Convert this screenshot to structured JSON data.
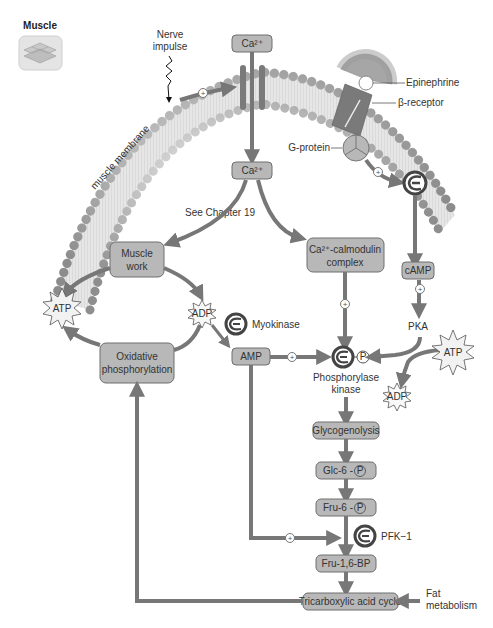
{
  "header": {
    "title": "Muscle",
    "icon": "muscle-tissue-icon"
  },
  "membrane": {
    "label": "muscle membrane",
    "nerve_impulse": [
      "Nerve",
      "impulse"
    ],
    "epinephrine": "Epinephrine",
    "beta_receptor": "β-receptor",
    "g_protein": "G-protein"
  },
  "nodes": {
    "ca_top": "Ca²⁺",
    "ca_inside": "Ca²⁺",
    "see_chapter": "See Chapter 19",
    "muscle_work": [
      "Muscle",
      "work"
    ],
    "ca_calmodulin": [
      "Ca²⁺-calmodulin",
      "complex"
    ],
    "camp": "cAMP",
    "pka": "PKA",
    "atp_left": "ATP",
    "adp_left": "ADP",
    "myokinase": "Myokinase",
    "amp": "AMP",
    "oxidative": [
      "Oxidative",
      "phosphorylation"
    ],
    "phosphorylase_kinase": [
      "Phosphorylase",
      "kinase"
    ],
    "phosphate": "P",
    "atp_right": "ATP",
    "adp_right": "ADP",
    "glycogenolysis": "Glycogenolysis",
    "glc6p": "Glc-6 -",
    "fru6p": "Fru-6 -",
    "pfk1": "PFK−1",
    "fru16bp": "Fru-1,6-BP",
    "tca": "Tricarboxylic acid cycle",
    "fat_metabolism": [
      "Fat",
      "metabolism"
    ]
  },
  "symbols": {
    "activation": "+"
  },
  "colors": {
    "box_fill": "#b8b8b8",
    "arrow": "#777777",
    "membrane_bead": "#a8a8a8",
    "membrane_fill": "#e0e0e0",
    "receptor": "#7a7a7a"
  }
}
